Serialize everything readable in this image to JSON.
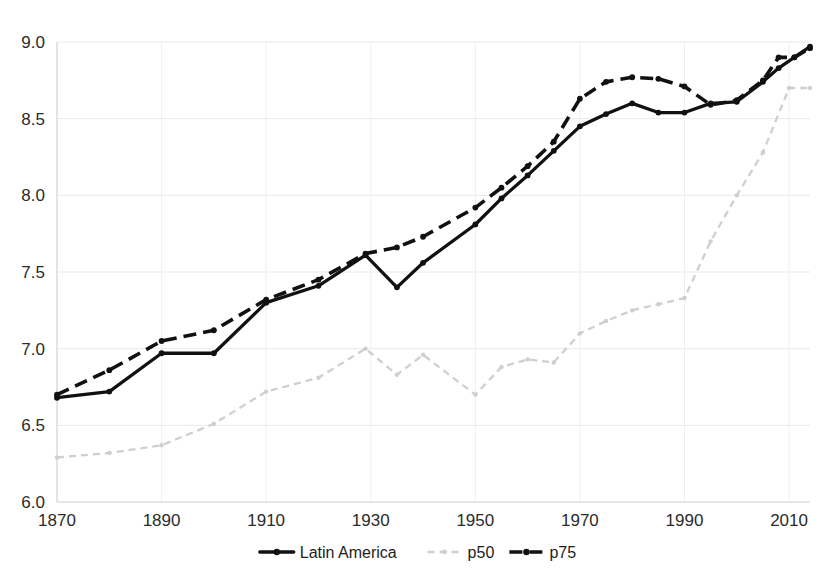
{
  "chart_data": {
    "type": "line",
    "title": "",
    "subtitle": "",
    "xlabel": "",
    "ylabel": "",
    "xlim": [
      1870,
      2014
    ],
    "ylim": [
      6.0,
      9.0
    ],
    "grid": true,
    "legend_position": "bottom",
    "xticks": [
      1870,
      1890,
      1910,
      1930,
      1950,
      1970,
      1990,
      2010
    ],
    "xtick_labels": [
      "1870",
      "1890",
      "1910",
      "1930",
      "1950",
      "1970",
      "1990",
      "2010"
    ],
    "yticks": [
      6.0,
      6.5,
      7.0,
      7.5,
      8.0,
      8.5,
      9.0
    ],
    "ytick_labels": [
      "6.0",
      "6.5",
      "7.0",
      "7.5",
      "8.0",
      "8.5",
      "9.0"
    ],
    "series": [
      {
        "name": "Latin America",
        "style": "solid",
        "color": "#111111",
        "markers": true,
        "x": [
          1870,
          1880,
          1890,
          1900,
          1910,
          1920,
          1929,
          1935,
          1940,
          1950,
          1955,
          1960,
          1965,
          1970,
          1975,
          1980,
          1985,
          1990,
          1995,
          2000,
          2005,
          2008,
          2011,
          2014
        ],
        "values": [
          6.68,
          6.72,
          6.97,
          6.97,
          7.3,
          7.41,
          7.61,
          7.4,
          7.56,
          7.81,
          7.98,
          8.13,
          8.29,
          8.45,
          8.53,
          8.6,
          8.54,
          8.54,
          8.6,
          8.61,
          8.74,
          8.83,
          8.9,
          8.97
        ]
      },
      {
        "name": "p75",
        "style": "dashed",
        "color": "#111111",
        "markers": true,
        "x": [
          1870,
          1880,
          1890,
          1900,
          1910,
          1920,
          1929,
          1935,
          1940,
          1950,
          1955,
          1960,
          1965,
          1970,
          1975,
          1980,
          1985,
          1990,
          1995,
          2000,
          2005,
          2008,
          2011,
          2014
        ],
        "values": [
          6.7,
          6.86,
          7.05,
          7.12,
          7.32,
          7.45,
          7.62,
          7.66,
          7.73,
          7.92,
          8.05,
          8.19,
          8.35,
          8.63,
          8.74,
          8.77,
          8.76,
          8.71,
          8.59,
          8.62,
          8.75,
          8.9,
          8.9,
          8.96
        ]
      },
      {
        "name": "p50",
        "style": "dotted",
        "color": "#cfcfcf",
        "markers": true,
        "x": [
          1870,
          1880,
          1890,
          1900,
          1910,
          1920,
          1929,
          1935,
          1940,
          1950,
          1955,
          1960,
          1965,
          1970,
          1975,
          1980,
          1985,
          1990,
          1995,
          2000,
          2005,
          2010,
          2014
        ],
        "values": [
          6.29,
          6.32,
          6.37,
          6.51,
          6.72,
          6.81,
          7.0,
          6.83,
          6.96,
          6.7,
          6.88,
          6.93,
          6.91,
          7.1,
          7.18,
          7.25,
          7.29,
          7.33,
          7.7,
          8.0,
          8.28,
          8.7,
          8.7
        ]
      }
    ]
  },
  "legend": {
    "items": [
      {
        "label": "Latin America",
        "style": "solid",
        "color": "#111111"
      },
      {
        "label": "p50",
        "style": "dotted",
        "color": "#cfcfcf"
      },
      {
        "label": "p75",
        "style": "dashed",
        "color": "#111111"
      }
    ]
  }
}
